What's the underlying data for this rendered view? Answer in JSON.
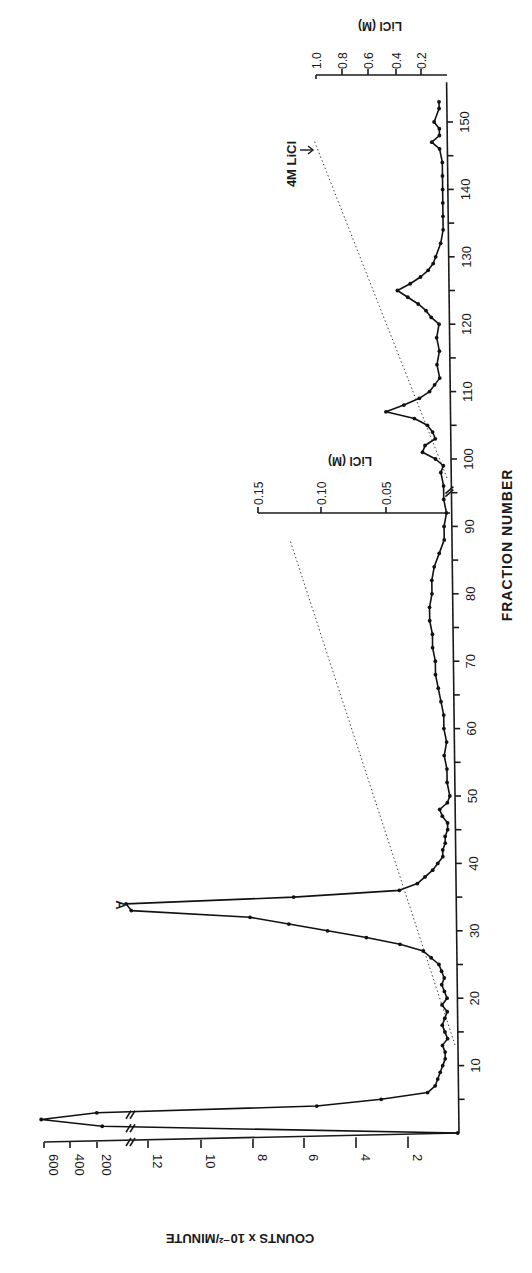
{
  "chart_data": {
    "type": "line",
    "title": "",
    "orientation": "rotated 90 degrees clockwise (fraction axis vertical, counts horizontal increasing leftward)",
    "xlabel": "FRACTION NUMBER",
    "ylabel": "COUNTS x 10-2/MINUTE",
    "x_ticks": [
      10,
      20,
      30,
      40,
      50,
      60,
      70,
      80,
      90,
      100,
      110,
      120,
      130,
      140,
      150
    ],
    "y_ticks_lower": [
      2,
      4,
      6,
      8,
      10,
      12
    ],
    "y_ticks_upper_after_break": [
      200,
      400,
      600
    ],
    "ylim": [
      0,
      13
    ],
    "y_break": "axis break between 12 and 200",
    "secondary_axes": [
      {
        "label": "LiCl (M)",
        "ticks": [
          "0.05",
          "0.10",
          "0.15"
        ],
        "position": "at fraction 92",
        "range": [
          0,
          0.15
        ]
      },
      {
        "label": "LiCl (M)",
        "ticks": [
          "0.2",
          "0.4",
          "0.6",
          "0.8",
          "1.0"
        ],
        "position": "at fraction 155",
        "range": [
          0,
          1.0
        ]
      }
    ],
    "annotations": [
      {
        "text": "A",
        "at_fraction": 34,
        "note": "main peak"
      },
      {
        "text": "4M LiCl",
        "at_fraction": 145,
        "arrow": true
      }
    ],
    "x_break": "axis break near fraction 95",
    "series": [
      {
        "name": "Counts",
        "x": [
          0,
          1,
          2,
          3,
          4,
          5,
          6,
          7,
          8,
          9,
          10,
          11,
          12,
          13,
          14,
          15,
          16,
          17,
          18,
          19,
          20,
          21,
          22,
          23,
          24,
          25,
          26,
          27,
          28,
          29,
          30,
          31,
          32,
          33,
          34,
          35,
          36,
          37,
          38,
          39,
          40,
          41,
          42,
          43,
          44,
          45,
          46,
          47,
          48,
          49,
          50,
          52,
          54,
          56,
          58,
          60,
          62,
          64,
          66,
          68,
          70,
          72,
          74,
          76,
          78,
          80,
          82,
          84,
          86,
          88,
          90,
          92,
          94,
          96,
          98,
          99,
          100,
          101,
          102,
          103,
          104,
          105,
          106,
          107,
          108,
          109,
          110,
          111,
          112,
          114,
          116,
          118,
          120,
          121,
          122,
          123,
          124,
          125,
          126,
          127,
          128,
          129,
          130,
          132,
          134,
          136,
          138,
          140,
          142,
          144,
          146,
          147,
          148,
          149,
          150,
          152,
          153
        ],
        "values": [
          0.05,
          160,
          620,
          200,
          5.5,
          3.0,
          1.2,
          0.9,
          0.8,
          0.7,
          0.6,
          0.5,
          0.5,
          0.6,
          0.4,
          0.5,
          0.6,
          0.5,
          0.4,
          0.6,
          0.4,
          0.5,
          0.6,
          0.5,
          0.6,
          0.7,
          1.0,
          1.3,
          2.2,
          3.5,
          5.0,
          6.5,
          8.0,
          12.6,
          12.8,
          6.3,
          2.2,
          1.5,
          1.2,
          0.9,
          0.7,
          0.5,
          0.5,
          0.4,
          0.4,
          0.3,
          0.3,
          0.5,
          0.6,
          0.3,
          0.2,
          0.3,
          0.3,
          0.4,
          0.3,
          0.4,
          0.4,
          0.5,
          0.6,
          0.7,
          0.7,
          0.8,
          0.8,
          0.9,
          0.9,
          0.8,
          0.8,
          0.7,
          0.5,
          0.3,
          0.3,
          0.2,
          0.3,
          0.3,
          0.4,
          0.3,
          0.6,
          1.1,
          1.0,
          0.6,
          0.7,
          0.9,
          1.4,
          2.5,
          1.8,
          1.2,
          0.8,
          0.6,
          0.4,
          0.5,
          0.4,
          0.5,
          0.4,
          0.7,
          0.9,
          1.2,
          1.6,
          2.0,
          1.5,
          1.1,
          0.8,
          0.6,
          0.5,
          0.3,
          0.2,
          0.2,
          0.2,
          0.2,
          0.2,
          0.2,
          0.3,
          0.6,
          0.3,
          0.3,
          0.5,
          0.3,
          0.3
        ]
      }
    ],
    "gradient_lines": [
      {
        "name": "LiCl gradient 0-0.15M",
        "style": "dotted",
        "from": {
          "fraction": 13,
          "licl": 0
        },
        "to": {
          "fraction": 92,
          "licl": 0.12
        }
      },
      {
        "name": "LiCl gradient to 4M",
        "style": "dotted",
        "from": {
          "fraction": 97,
          "licl": 0
        },
        "to": {
          "fraction": 147,
          "licl": 0.3
        }
      }
    ],
    "grid": false,
    "legend": null
  },
  "labels": {
    "fraction_axis_title": "FRACTION NUMBER",
    "counts_axis_title": "COUNTS x 10⁻²/MINUTE",
    "licl_lower_title": "LiCl   (M)",
    "licl_upper_title": "LiCl   (M)",
    "peak_label": "A",
    "four_m_label": "4M LiCl",
    "arrow": "↓"
  }
}
